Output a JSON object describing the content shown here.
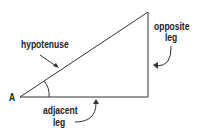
{
  "diagram": {
    "vertex_label": "A",
    "labels": {
      "hypotenuse": "hypotenuse",
      "opposite_line1": "opposite",
      "opposite_line2": "leg",
      "adjacent_line1": "adjacent",
      "adjacent_line2": "leg"
    },
    "colors": {
      "stroke": "#222222",
      "background": "#ffffff"
    }
  }
}
